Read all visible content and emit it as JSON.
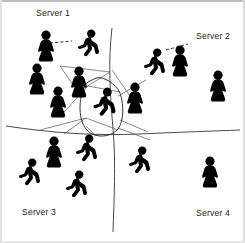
{
  "diagram": {
    "type": "spatial-partition",
    "background_color": "#ffffff",
    "figure_color": "#000000",
    "line_color": "#4a4a4a",
    "label_color": "#1c1c1c",
    "width": 245,
    "height": 243
  },
  "labels": [
    {
      "id": "server-1",
      "text": "Server 1",
      "x": 36,
      "y": 9
    },
    {
      "id": "server-2",
      "text": "Server 2",
      "x": 196,
      "y": 32
    },
    {
      "id": "server-3",
      "text": "Server 3",
      "x": 22,
      "y": 208
    },
    {
      "id": "server-4",
      "text": "Server 4",
      "x": 196,
      "y": 209
    }
  ],
  "regions": [
    {
      "id": "region-server-1",
      "label": "Server 1",
      "quadrant": "top-left",
      "avatar_count": 8
    },
    {
      "id": "region-server-2",
      "label": "Server 2",
      "quadrant": "top-right",
      "avatar_count": 4
    },
    {
      "id": "region-server-3",
      "label": "Server 3",
      "quadrant": "bottom-left",
      "avatar_count": 4
    },
    {
      "id": "region-server-4",
      "label": "Server 4",
      "quadrant": "bottom-right",
      "avatar_count": 2
    }
  ],
  "dividers": {
    "vertical": "M112,28 C108,60 110,96 113,128 C116,164 114,200 113,232",
    "horizontal": "M6,126 C52,133 96,136 140,134 C182,132 216,131 240,130"
  },
  "cell_outline": "M88,82 C83,86 80,96 80,108 C80,120 84,130 92,134 C101,138 112,136 118,129 C124,121 124,104 120,93 C116,84 104,76 96,78 Z",
  "mesh_edges": [
    "M60,66 L110,72 L78,92 Z",
    "M64,112 L88,86 L120,92",
    "M40,130 L86,118 L118,130",
    "M118,96 L146,80",
    "M118,128 L150,140",
    "M86,118 L64,134",
    "M120,120 L148,132",
    "M112,70 L130,96",
    "M96,136 L86,126"
  ],
  "interest_links": [
    {
      "id": "link-top-left",
      "x1": 50,
      "y1": 43,
      "x2": 72,
      "y2": 41,
      "style": "dashed"
    },
    {
      "id": "link-top-right",
      "x1": 166,
      "y1": 50,
      "x2": 188,
      "y2": 44,
      "style": "dashed"
    }
  ],
  "avatars": [
    {
      "id": "a1",
      "server": "Server 1",
      "pose": "standing",
      "x": 33,
      "y": 30,
      "scale": 1.0
    },
    {
      "id": "a2",
      "server": "Server 1",
      "pose": "running",
      "x": 76,
      "y": 29,
      "scale": 1.0
    },
    {
      "id": "a3",
      "server": "Server 1",
      "pose": "standing",
      "x": 24,
      "y": 63,
      "scale": 1.0
    },
    {
      "id": "a4",
      "server": "Server 1",
      "pose": "standing",
      "x": 66,
      "y": 66,
      "scale": 1.0
    },
    {
      "id": "a5",
      "server": "Server 1",
      "pose": "standing",
      "x": 45,
      "y": 86,
      "scale": 1.0
    },
    {
      "id": "a6",
      "server": "Server 1",
      "pose": "standing",
      "x": 122,
      "y": 82,
      "scale": 1.0
    },
    {
      "id": "a7",
      "server": "Server 1",
      "pose": "running",
      "x": 92,
      "y": 88,
      "scale": 1.05,
      "highlighted": true
    },
    {
      "id": "a8",
      "server": "Server 2",
      "pose": "running",
      "x": 142,
      "y": 48,
      "scale": 1.0
    },
    {
      "id": "a9",
      "server": "Server 2",
      "pose": "standing",
      "x": 167,
      "y": 45,
      "scale": 1.0
    },
    {
      "id": "a10",
      "server": "Server 2",
      "pose": "standing",
      "x": 205,
      "y": 70,
      "scale": 1.0
    },
    {
      "id": "a11",
      "server": "Server 3",
      "pose": "standing",
      "x": 41,
      "y": 136,
      "scale": 1.0
    },
    {
      "id": "a12",
      "server": "Server 3",
      "pose": "running",
      "x": 74,
      "y": 134,
      "scale": 1.0
    },
    {
      "id": "a13",
      "server": "Server 3",
      "pose": "running",
      "x": 17,
      "y": 158,
      "scale": 1.0
    },
    {
      "id": "a14",
      "server": "Server 3",
      "pose": "running",
      "x": 64,
      "y": 170,
      "scale": 1.0
    },
    {
      "id": "a15",
      "server": "Server 4",
      "pose": "running",
      "x": 127,
      "y": 146,
      "scale": 1.0
    },
    {
      "id": "a16",
      "server": "Server 4",
      "pose": "standing",
      "x": 197,
      "y": 156,
      "scale": 1.0
    }
  ]
}
